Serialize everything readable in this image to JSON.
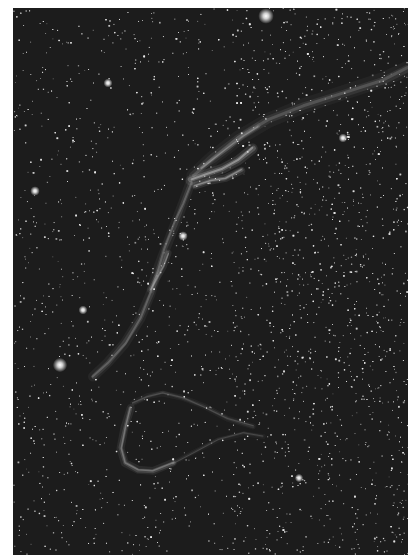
{
  "image": {
    "subject": "Veil Nebula (NGC 6960 / Western Veil) starfield, monochrome astrophotograph",
    "background_color": "#ffffff",
    "sky_color": "#1c1c1c",
    "star_color": "#e8e8e8",
    "nebula_color": "#bdbdbd",
    "frame": {
      "left": 13,
      "top": 8,
      "width": 395,
      "height": 547
    },
    "star_count": 5200,
    "bright_stars": [
      {
        "x": 253,
        "y": 8,
        "r": 2.6
      },
      {
        "x": 47,
        "y": 357,
        "r": 2.4
      },
      {
        "x": 22,
        "y": 183,
        "r": 1.6
      },
      {
        "x": 170,
        "y": 228,
        "r": 1.6
      },
      {
        "x": 70,
        "y": 302,
        "r": 1.5
      },
      {
        "x": 95,
        "y": 75,
        "r": 1.5
      },
      {
        "x": 330,
        "y": 130,
        "r": 1.5
      },
      {
        "x": 286,
        "y": 470,
        "r": 1.4
      }
    ],
    "filaments": [
      {
        "points": [
          [
            180,
            168
          ],
          [
            200,
            150
          ],
          [
            225,
            130
          ],
          [
            255,
            112
          ],
          [
            290,
            98
          ],
          [
            330,
            85
          ],
          [
            370,
            72
          ],
          [
            395,
            60
          ]
        ],
        "width": 3,
        "alpha": 0.22
      },
      {
        "points": [
          [
            178,
            172
          ],
          [
            195,
            165
          ],
          [
            210,
            160
          ],
          [
            225,
            152
          ],
          [
            240,
            140
          ]
        ],
        "width": 2,
        "alpha": 0.55
      },
      {
        "points": [
          [
            182,
            178
          ],
          [
            198,
            172
          ],
          [
            212,
            170
          ],
          [
            228,
            162
          ]
        ],
        "width": 1.5,
        "alpha": 0.5
      },
      {
        "points": [
          [
            188,
            160
          ],
          [
            200,
            152
          ],
          [
            215,
            140
          ],
          [
            230,
            128
          ],
          [
            245,
            118
          ]
        ],
        "width": 1.2,
        "alpha": 0.35
      },
      {
        "points": [
          [
            178,
            175
          ],
          [
            170,
            195
          ],
          [
            162,
            215
          ],
          [
            152,
            240
          ],
          [
            145,
            262
          ],
          [
            138,
            285
          ],
          [
            128,
            310
          ],
          [
            112,
            335
          ],
          [
            95,
            355
          ],
          [
            80,
            368
          ]
        ],
        "width": 2,
        "alpha": 0.28
      },
      {
        "points": [
          [
            155,
            245
          ],
          [
            150,
            258
          ],
          [
            144,
            270
          ],
          [
            138,
            282
          ]
        ],
        "width": 1.4,
        "alpha": 0.4
      },
      {
        "points": [
          [
            118,
            400
          ],
          [
            112,
            420
          ],
          [
            108,
            440
          ],
          [
            112,
            455
          ],
          [
            125,
            462
          ],
          [
            140,
            463
          ],
          [
            160,
            455
          ]
        ],
        "width": 1.6,
        "alpha": 0.38
      },
      {
        "points": [
          [
            120,
            395
          ],
          [
            135,
            388
          ],
          [
            150,
            385
          ],
          [
            170,
            390
          ],
          [
            190,
            398
          ],
          [
            215,
            410
          ],
          [
            240,
            418
          ]
        ],
        "width": 1.2,
        "alpha": 0.2
      },
      {
        "points": [
          [
            160,
            455
          ],
          [
            180,
            445
          ],
          [
            205,
            432
          ],
          [
            230,
            425
          ],
          [
            250,
            428
          ]
        ],
        "width": 1,
        "alpha": 0.18
      }
    ]
  }
}
